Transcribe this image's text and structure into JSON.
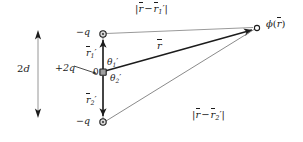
{
  "figure": {
    "background_color": "#ffffff",
    "ink_color": "#1c1c1c",
    "thin_line_color": "#8c8c8c",
    "width": 303,
    "height": 142
  },
  "labels": {
    "separation": {
      "base": "2",
      "italic": "d",
      "text": "2d"
    },
    "charge_top": {
      "text": "−q",
      "sign": "−",
      "symbol": "q"
    },
    "charge_middle": {
      "text": "+2q",
      "sign": "+",
      "magnitude": "2",
      "symbol": "q"
    },
    "charge_bottom": {
      "text": "−q",
      "sign": "−",
      "symbol": "q"
    },
    "origin": {
      "text": "0"
    },
    "vector_r1_prime": {
      "symbol": "r",
      "subscript": "1",
      "prime": "′",
      "text": "r⃗1′"
    },
    "vector_r2_prime": {
      "symbol": "r",
      "subscript": "2",
      "prime": "′",
      "text": "r⃗2′"
    },
    "angle_theta1": {
      "symbol": "θ",
      "subscript": "1",
      "prime": "′",
      "text": "θ1′"
    },
    "angle_theta2": {
      "symbol": "θ",
      "subscript": "2",
      "prime": "′",
      "text": "θ2′"
    },
    "vector_r": {
      "symbol": "r",
      "text": "r⃗"
    },
    "distance_top": {
      "open_bar": "|",
      "symbol_a": "r",
      "minus": "−",
      "symbol_b": "r",
      "subscript": "1",
      "prime": "′",
      "close_bar": "|",
      "text": "|r⃗ − r⃗1′|"
    },
    "distance_bottom": {
      "open_bar": "|",
      "symbol_a": "r",
      "minus": "−",
      "symbol_b": "r",
      "subscript": "2",
      "prime": "′",
      "close_bar": "|",
      "text": "|r⃗ − r⃗2′|"
    },
    "field_point": {
      "symbol": "ϕ",
      "open_paren": "(",
      "argument": "r",
      "close_paren": ")",
      "text": "ϕ(r⃗)"
    }
  },
  "geometry": {
    "axis_x": 103,
    "charge_top_y": 34,
    "origin_y": 72,
    "charge_bottom_y": 122,
    "field_point": {
      "x": 257,
      "y": 28
    },
    "dimension_arrow": {
      "x": 38,
      "y_top": 32,
      "y_bottom": 116
    }
  }
}
